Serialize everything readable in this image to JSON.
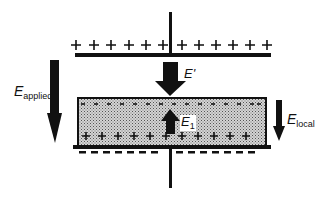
{
  "diagram": {
    "type": "parallel-plate capacitor with dielectric slab",
    "colors": {
      "ink": "#111111",
      "slab_fill": "#bdbdbd",
      "background": "#ffffff"
    },
    "top_plate": {
      "charge_symbol": "+",
      "charge_count": 13
    },
    "bottom_plate": {
      "charge_symbol": "-",
      "charge_count": 14
    },
    "dielectric": {
      "top_surface_charge": "-",
      "top_surface_count": 15,
      "bottom_surface_charge": "+",
      "bottom_surface_count": 11
    },
    "labels": {
      "e_applied_main": "E",
      "e_applied_sub": "applied",
      "e_prime": "E'",
      "e1_main": "E",
      "e1_sub": "1",
      "e_local_main": "E",
      "e_local_sub": "local"
    },
    "arrows": [
      {
        "name": "E_applied",
        "direction": "down"
      },
      {
        "name": "E'",
        "direction": "down"
      },
      {
        "name": "E1",
        "direction": "up"
      },
      {
        "name": "E_local",
        "direction": "down"
      }
    ]
  }
}
